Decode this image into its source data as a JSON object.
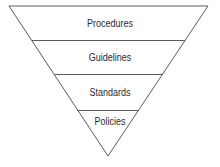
{
  "diagram": {
    "type": "inverted-pyramid",
    "layers": [
      {
        "label": "Procedures"
      },
      {
        "label": "Guidelines"
      },
      {
        "label": "Standards"
      },
      {
        "label": "Policies"
      }
    ],
    "colors": {
      "line": "#5a5a5a",
      "text": "#2a2a2a",
      "background": "#ffffff"
    }
  }
}
